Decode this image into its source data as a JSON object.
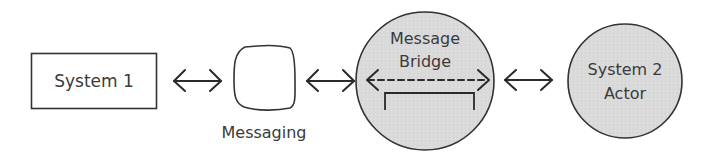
{
  "diagram": {
    "nodes": [
      {
        "id": "system1",
        "shape": "rectangle",
        "label": "System 1"
      },
      {
        "id": "messaging",
        "shape": "rounded-square",
        "label": "Messaging"
      },
      {
        "id": "bridge",
        "shape": "circle",
        "label_line1": "Message",
        "label_line2": "Bridge",
        "fill": "#dadada"
      },
      {
        "id": "system2",
        "shape": "circle",
        "label_line1": "System 2",
        "label_line2": "Actor",
        "fill": "#dadada"
      }
    ],
    "connectors": [
      {
        "from": "system1",
        "to": "messaging",
        "type": "bidirectional-arrow"
      },
      {
        "from": "messaging",
        "to": "bridge",
        "type": "bidirectional-arrow"
      },
      {
        "from": "bridge",
        "to": "system2",
        "type": "bidirectional-arrow"
      }
    ],
    "colors": {
      "stroke": "#333333",
      "circle_fill": "#dadada",
      "text": "#3a3a3a"
    }
  }
}
